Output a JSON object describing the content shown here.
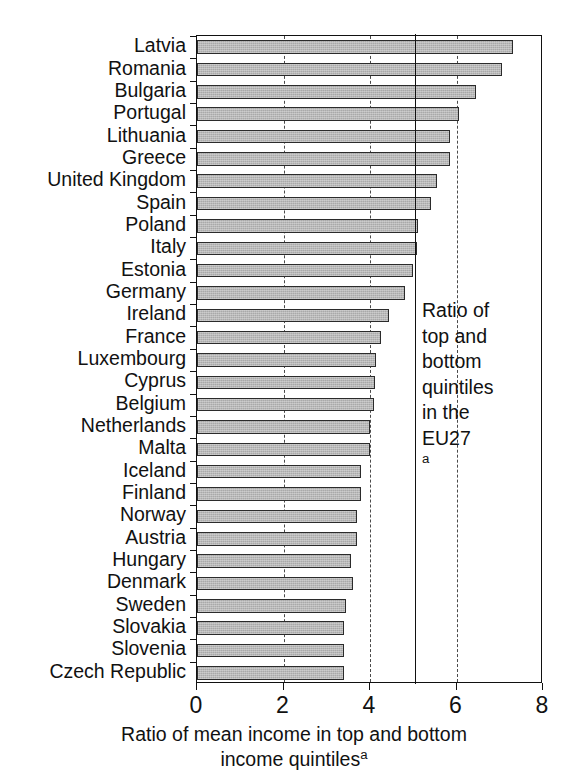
{
  "chart_data": {
    "type": "bar",
    "orientation": "horizontal",
    "title": "",
    "xlabel": "Ratio of mean income in top and bottom income quintilesᵃ",
    "xlabel_line1": "Ratio of mean income in top and bottom",
    "xlabel_line2": "income quintiles",
    "xlabel_superscript": "a",
    "ylabel": "",
    "xlim": [
      0,
      8
    ],
    "xticks": [
      0,
      2,
      4,
      6,
      8
    ],
    "xtick_labels": [
      "0",
      "2",
      "4",
      "6",
      "8"
    ],
    "gridlines_x": [
      2,
      4,
      6
    ],
    "grid": "dashed vertical at 2, 4, 6",
    "legend": "none",
    "reference_line": {
      "value": 5.05,
      "style": "solid",
      "label_lines": [
        "Ratio of",
        "top and",
        "bottom",
        "quintiles",
        "in the",
        "EU27"
      ],
      "label_superscript": "a"
    },
    "bar_color": "#a9a9a9",
    "bar_edge_color": "#2b2b2b",
    "categories": [
      "Latvia",
      "Romania",
      "Bulgaria",
      "Portugal",
      "Lithuania",
      "Greece",
      "United Kingdom",
      "Spain",
      "Poland",
      "Italy",
      "Estonia",
      "Germany",
      "Ireland",
      "France",
      "Luxembourg",
      "Cyprus",
      "Belgium",
      "Netherlands",
      "Malta",
      "Iceland",
      "Finland",
      "Norway",
      "Austria",
      "Hungary",
      "Denmark",
      "Sweden",
      "Slovakia",
      "Slovenia",
      "Czech Republic"
    ],
    "values": [
      7.3,
      7.05,
      6.45,
      6.05,
      5.85,
      5.85,
      5.55,
      5.4,
      5.1,
      5.08,
      5.0,
      4.8,
      4.45,
      4.25,
      4.15,
      4.12,
      4.1,
      4.0,
      4.0,
      3.8,
      3.8,
      3.7,
      3.7,
      3.55,
      3.6,
      3.45,
      3.4,
      3.4,
      3.4
    ]
  },
  "axis": {
    "x_title_line1": "Ratio of mean income in top and bottom",
    "x_title_line2": "income quintiles",
    "x_title_sup": "a"
  },
  "annotation": {
    "line1": "Ratio of",
    "line2": "top and",
    "line3": "bottom",
    "line4": "quintiles",
    "line5": "in the",
    "line6": "EU27",
    "sup": "a"
  }
}
